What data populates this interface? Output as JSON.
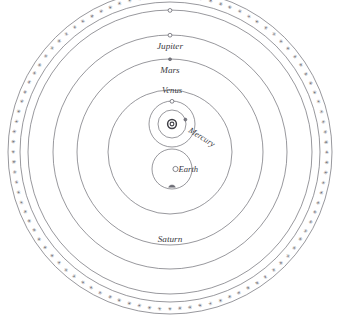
{
  "diagram": {
    "type": "astronomical-cosmological-model",
    "system_name": "Tychonic geo-heliocentric system",
    "background_color": "#ffffff",
    "line_color": "#6b6b73",
    "text_color": "#3a3a42",
    "center": {
      "x": 170,
      "y": 152
    },
    "firmament": {
      "name": "star-band",
      "outer_radius": 162,
      "inner_radius": 150,
      "star_glyph": "star-icon",
      "star_symbol": "✳",
      "star_count": 96
    },
    "orbits": [
      {
        "name": "saturn-orbit",
        "radius": 142,
        "center": {
          "x": 170,
          "y": 152
        }
      },
      {
        "name": "jupiter-orbit",
        "radius": 117,
        "center": {
          "x": 170,
          "y": 152
        }
      },
      {
        "name": "mars-orbit",
        "radius": 93,
        "center": {
          "x": 170,
          "y": 152
        }
      },
      {
        "name": "sun-orbit",
        "radius": 62,
        "center": {
          "x": 170,
          "y": 152
        }
      },
      {
        "name": "venus-orbit",
        "radius": 23,
        "center": {
          "x": 172,
          "y": 124
        }
      },
      {
        "name": "mercury-orbit",
        "radius": 14,
        "center": {
          "x": 172,
          "y": 124
        }
      },
      {
        "name": "moon-orbit",
        "radius": 20,
        "center": {
          "x": 172,
          "y": 169
        }
      }
    ],
    "bodies": [
      {
        "name": "sun",
        "label": "",
        "x": 172,
        "y": 124,
        "marker": "sun-symbol"
      },
      {
        "name": "earth",
        "label": "Earth",
        "x": 172,
        "y": 169,
        "marker": "open-circle",
        "label_x": 186,
        "label_y": 170
      },
      {
        "name": "mercury",
        "label": "Mercury",
        "x": 186,
        "y": 120,
        "marker": "small-dot",
        "label_x": 207,
        "label_y": 127,
        "label_rotation": 32
      },
      {
        "name": "venus",
        "label": "Venus",
        "x": 172,
        "y": 101,
        "marker": "small-circle",
        "label_x": 172,
        "label_y": 92
      },
      {
        "name": "mars",
        "label": "Mars",
        "x": 170,
        "y": 59,
        "marker": "small-dot",
        "label_x": 170,
        "label_y": 71
      },
      {
        "name": "jupiter",
        "label": "Jupiter",
        "x": 170,
        "y": 35,
        "marker": "small-circle",
        "label_x": 170,
        "label_y": 47
      },
      {
        "name": "saturn",
        "label": "Saturn",
        "x": 170,
        "y": 10,
        "marker": "small-circle",
        "label_x": 170,
        "label_y": 240
      },
      {
        "name": "moon",
        "label": "",
        "x": 172,
        "y": 184,
        "marker": "moon-symbol"
      }
    ],
    "labels": {
      "jupiter": "Jupiter",
      "mars": "Mars",
      "venus": "Venus",
      "mercury": "Mercury",
      "earth": "Earth",
      "saturn": "Saturn"
    },
    "top_fragment": ""
  }
}
